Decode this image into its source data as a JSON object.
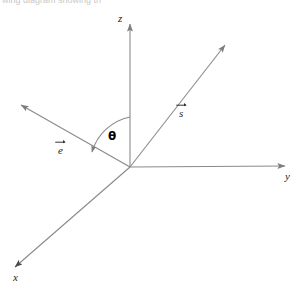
{
  "figure": {
    "width": 302,
    "height": 289,
    "background_color": "#ffffff",
    "stroke_color": "#8a8a8a",
    "label_color": "#1d1d1d",
    "clipped_top_text": "wing diagram showing th"
  },
  "axes": {
    "origin": {
      "x": 130,
      "y": 167
    },
    "items": [
      {
        "id": "z",
        "label": "z",
        "label_x": 118,
        "label_y": 13,
        "tip_x": 130,
        "tip_y": 22,
        "direction": "up"
      },
      {
        "id": "y",
        "label": "y",
        "label_x": 285,
        "label_y": 170,
        "tip_x": 287,
        "tip_y": 166,
        "direction": "right"
      },
      {
        "id": "x",
        "label": "x",
        "label_x": 13,
        "label_y": 272,
        "tip_x": 13,
        "tip_y": 269,
        "direction": "down-left"
      }
    ]
  },
  "vectors": [
    {
      "id": "e",
      "letter": "e",
      "label_x": 57,
      "label_y": 144,
      "tip_x": 18,
      "tip_y": 103,
      "has_overarrow": true
    },
    {
      "id": "s",
      "letter": "s",
      "label_x": 178,
      "label_y": 107,
      "tip_x": 228,
      "tip_y": 42,
      "has_overarrow": true
    }
  ],
  "angle": {
    "symbol": "θ",
    "label_x": 108,
    "label_y": 130,
    "from_axis": "z",
    "to_vector": "e",
    "arrowhead_at": "e"
  }
}
